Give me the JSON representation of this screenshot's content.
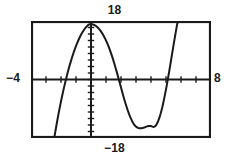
{
  "figure": {
    "kind": "graphing-calculator-window",
    "labels": {
      "ymax": "18",
      "ymin": "−18",
      "xmin": "−4",
      "xmax": "8"
    },
    "colors": {
      "ink": "#1a1a1a",
      "frame": "#1a1a1a",
      "background": "#ffffff",
      "curve": "#1a1a1a"
    }
  },
  "chart_data": {
    "type": "line",
    "title": "",
    "xlabel": "",
    "ylabel": "",
    "xlim": [
      -4,
      8
    ],
    "ylim": [
      -18,
      18
    ],
    "grid": false,
    "legend": null,
    "axes": {
      "x_axis_at_y": 0,
      "y_axis_at_x": 0,
      "x_tick_step": 1,
      "y_tick_step": 2,
      "x_ticks": [
        -4,
        -3,
        -2,
        -1,
        0,
        1,
        2,
        3,
        4,
        5,
        6,
        7,
        8
      ],
      "y_ticks": [
        -18,
        -16,
        -14,
        -12,
        -10,
        -8,
        -6,
        -4,
        -2,
        0,
        2,
        4,
        6,
        8,
        10,
        12,
        14,
        16,
        18
      ]
    },
    "annotations": {
      "window_top": "18",
      "window_bottom": "−18",
      "window_left": "−4",
      "window_right": "8"
    },
    "features": {
      "local_maximum": {
        "x": -0.2,
        "y": 17.0
      },
      "local_minimum": {
        "x": 4.4,
        "y": -14.5
      },
      "x_intercepts": [
        -1.9,
        1.3,
        6.6
      ]
    },
    "series": [
      {
        "name": "curve",
        "x": [
          -2.45,
          -2.35,
          -2.25,
          -2.15,
          -2.05,
          -1.95,
          -1.85,
          -1.75,
          -1.65,
          -1.55,
          -1.45,
          -1.35,
          -1.25,
          -1.15,
          -1.05,
          -0.95,
          -0.85,
          -0.75,
          -0.65,
          -0.55,
          -0.45,
          -0.35,
          -0.25,
          -0.15,
          -0.05,
          0.05,
          0.15,
          0.25,
          0.35,
          0.45,
          0.55,
          0.65,
          0.75,
          0.85,
          0.95,
          1.05,
          1.15,
          1.25,
          1.35,
          1.45,
          1.55,
          1.65,
          1.75,
          1.85,
          1.95,
          2.05,
          2.15,
          2.25,
          2.35,
          2.45,
          2.55,
          2.65,
          2.75,
          2.85,
          2.95,
          3.05,
          3.15,
          3.25,
          3.35,
          3.45,
          3.55,
          3.65,
          3.75,
          3.85,
          3.95,
          4.05,
          4.15,
          4.25,
          4.35,
          4.45,
          4.55,
          4.65,
          4.75,
          4.85,
          4.95,
          5.05,
          5.15,
          5.25,
          5.35,
          5.45,
          5.55,
          5.65,
          5.75,
          5.85,
          5.95,
          6.05,
          6.15,
          6.25,
          6.35,
          6.45,
          6.55,
          6.65,
          6.75,
          6.85,
          6.95,
          7.05,
          7.15
        ],
        "y": [
          -18.0,
          -15.3,
          -12.7,
          -10.2,
          -7.9,
          -5.6,
          -3.5,
          -1.5,
          0.4,
          2.2,
          3.9,
          5.5,
          7.0,
          8.4,
          9.7,
          10.9,
          12.0,
          13.0,
          13.9,
          14.7,
          15.4,
          16.0,
          16.5,
          16.9,
          17.0,
          17.0,
          16.9,
          16.7,
          16.4,
          16.0,
          15.5,
          14.9,
          14.2,
          13.4,
          12.5,
          11.5,
          10.4,
          9.2,
          7.9,
          6.5,
          5.0,
          3.4,
          1.8,
          0.1,
          -1.6,
          -3.3,
          -5.0,
          -6.6,
          -8.1,
          -9.5,
          -10.8,
          -11.9,
          -12.9,
          -13.7,
          -14.3,
          -14.7,
          -14.9,
          -15.0,
          -15.0,
          -14.9,
          -14.8,
          -14.6,
          -14.4,
          -14.3,
          -14.3,
          -14.4,
          -14.6,
          -14.5,
          -14.0,
          -13.1,
          -11.9,
          -10.4,
          -8.6,
          -6.5,
          -4.2,
          -1.8,
          0.8,
          3.5,
          6.3,
          9.1,
          11.9,
          14.6,
          17.2,
          18.0,
          18.0,
          18.0,
          18.0,
          18.0,
          18.0,
          18.0,
          18.0,
          18.0,
          18.0,
          18.0,
          18.0,
          18.0,
          18.0
        ]
      }
    ]
  }
}
